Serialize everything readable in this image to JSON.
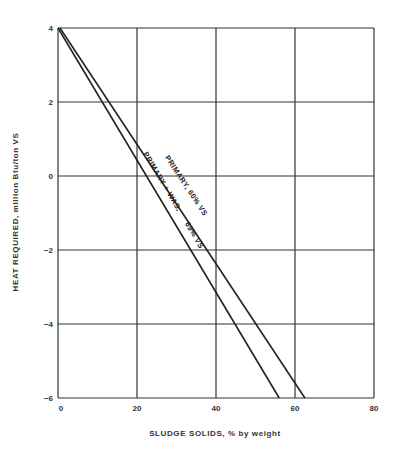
{
  "chart_data": {
    "type": "line",
    "title": "",
    "xlabel": "SLUDGE SOLIDS, % by weight",
    "ylabel": "HEAT REQUIRED, million Btu/ton VS",
    "xlim": [
      0,
      80
    ],
    "ylim": [
      -6,
      4
    ],
    "x_ticks": [
      "0",
      "20",
      "40",
      "60",
      "80"
    ],
    "y_ticks": [
      "4",
      "2",
      "0",
      "-2",
      "-4",
      "-6"
    ],
    "grid": true,
    "legend": "inline labels along lines",
    "series": [
      {
        "name": "PRIMARY + WAS, 69% VS",
        "x": [
          0,
          56
        ],
        "y": [
          4,
          -6
        ]
      },
      {
        "name": "PRIMARY, 60% VS",
        "x": [
          0.5,
          62.5
        ],
        "y": [
          4,
          -6
        ]
      }
    ]
  },
  "colors": {
    "line": "#222222",
    "grid": "#333333",
    "background": "#ffffff"
  }
}
